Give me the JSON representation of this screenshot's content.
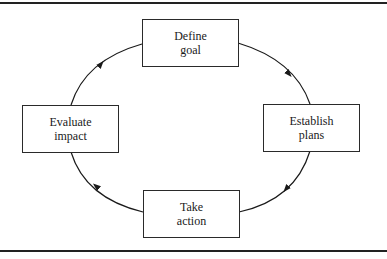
{
  "diagram": {
    "type": "cycle",
    "nodes": [
      {
        "id": "define",
        "line1": "Define",
        "line2": "goal"
      },
      {
        "id": "establish",
        "line1": "Establish",
        "line2": "plans"
      },
      {
        "id": "take",
        "line1": "Take",
        "line2": "action"
      },
      {
        "id": "evaluate",
        "line1": "Evaluate",
        "line2": "impact"
      }
    ],
    "edges": [
      {
        "from": "define",
        "to": "establish"
      },
      {
        "from": "establish",
        "to": "take"
      },
      {
        "from": "take",
        "to": "evaluate"
      },
      {
        "from": "evaluate",
        "to": "define"
      }
    ]
  }
}
